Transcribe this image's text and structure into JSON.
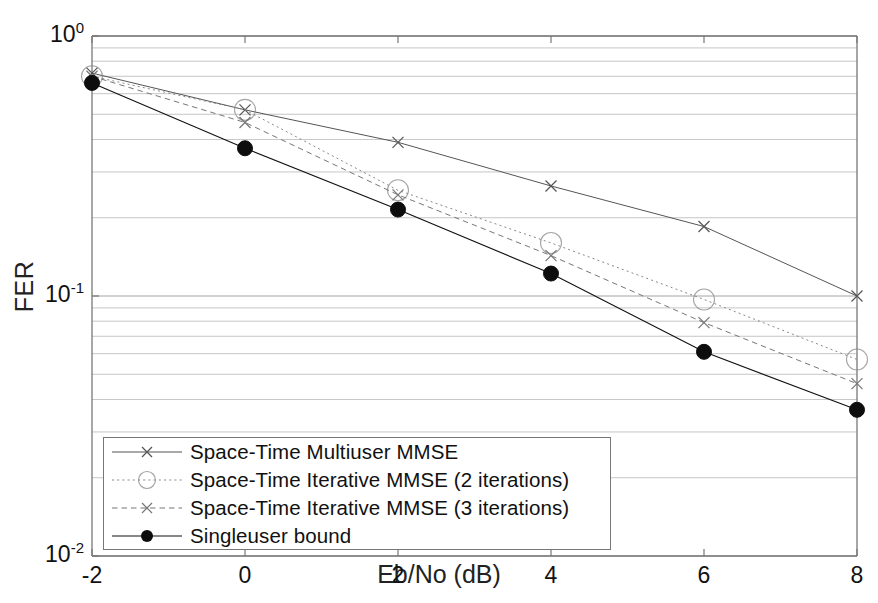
{
  "chart_data": {
    "type": "line",
    "title": "",
    "xlabel": "Eb/No (dB)",
    "ylabel": "FER",
    "xlim": [
      -2,
      8
    ],
    "ylim": [
      0.01,
      1
    ],
    "yscale": "log",
    "grid": true,
    "legend_position": "lower-left",
    "x": [
      -2,
      0,
      2,
      4,
      6,
      8
    ],
    "xticklabels": [
      "-2",
      "0",
      "2",
      "4",
      "6",
      "8"
    ],
    "yticklabels": [
      "10",
      "10",
      "10"
    ],
    "yticks": [
      1,
      0.1,
      0.01
    ],
    "yexponents": [
      "0",
      "-1",
      "-2"
    ],
    "series": [
      {
        "name": "Space-Time Multiuser MMSE",
        "marker": "x",
        "linestyle": "solid",
        "color": "#555555",
        "values": [
          0.72,
          0.52,
          0.39,
          0.265,
          0.185,
          0.1
        ]
      },
      {
        "name": "Space-Time Iterative MMSE (2 iterations)",
        "marker": "circle",
        "linestyle": "dotted",
        "color": "#888888",
        "values": [
          0.7,
          0.52,
          0.255,
          0.16,
          0.097,
          0.057
        ]
      },
      {
        "name": "Space-Time Iterative MMSE (3 iterations)",
        "marker": "x",
        "linestyle": "dashed",
        "color": "#777777",
        "values": [
          0.7,
          0.465,
          0.245,
          0.143,
          0.079,
          0.046
        ]
      },
      {
        "name": "Singleuser bound",
        "marker": "filled-circle",
        "linestyle": "solid",
        "color": "#111111",
        "values": [
          0.66,
          0.37,
          0.215,
          0.122,
          0.061,
          0.0365
        ]
      }
    ]
  },
  "axes": {
    "ylabel": "FER",
    "xlabel": "Eb/No (dB)",
    "xticks": [
      {
        "label": "-2"
      },
      {
        "label": "0"
      },
      {
        "label": "2"
      },
      {
        "label": "4"
      },
      {
        "label": "6"
      },
      {
        "label": "8"
      }
    ],
    "yticks": [
      {
        "mantissa": "10",
        "exponent": "0"
      },
      {
        "mantissa": "10",
        "exponent": "-1"
      },
      {
        "mantissa": "10",
        "exponent": "-2"
      }
    ]
  },
  "legend": {
    "entries": [
      {
        "label": "Space-Time Multiuser MMSE"
      },
      {
        "label": "Space-Time Iterative MMSE (2 iterations)"
      },
      {
        "label": "Space-Time Iterative MMSE (3 iterations)"
      },
      {
        "label": "Singleuser bound"
      }
    ]
  },
  "colors": {
    "axis": "#777777",
    "grid": "#8a8a8a",
    "text": "#111111",
    "dark_series": "#111111"
  }
}
